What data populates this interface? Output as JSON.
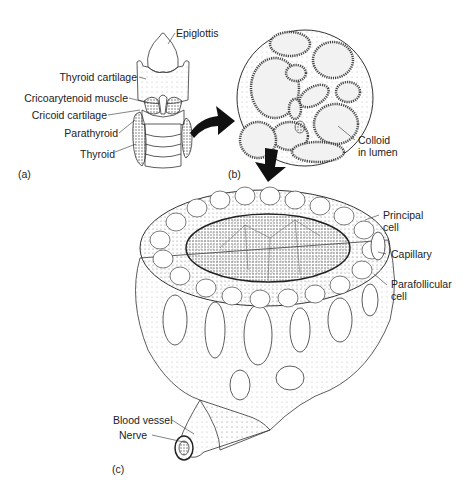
{
  "figure": {
    "panels": [
      {
        "id": "a",
        "label": "(a)",
        "subject": "larynx-and-thyroid-gland"
      },
      {
        "id": "b",
        "label": "(b)",
        "subject": "thyroid-follicles-micrograph"
      },
      {
        "id": "c",
        "label": "(c)",
        "subject": "single-thyroid-follicle"
      }
    ],
    "panel_a_labels": [
      "Epiglottis",
      "Thyroid cartilage",
      "Cricoarytenoid muscle",
      "Cricoid cartilage",
      "Parathyroid",
      "Thyroid"
    ],
    "panel_b_labels": [
      "Colloid",
      "in lumen"
    ],
    "panel_c_labels": [
      "Principal",
      "cell",
      "Capillary",
      "Parafollicular",
      "cell",
      "Blood vessel",
      "Nerve"
    ],
    "colors": {
      "ink": "#222222",
      "background": "#ffffff",
      "stipple": "#999999"
    }
  }
}
